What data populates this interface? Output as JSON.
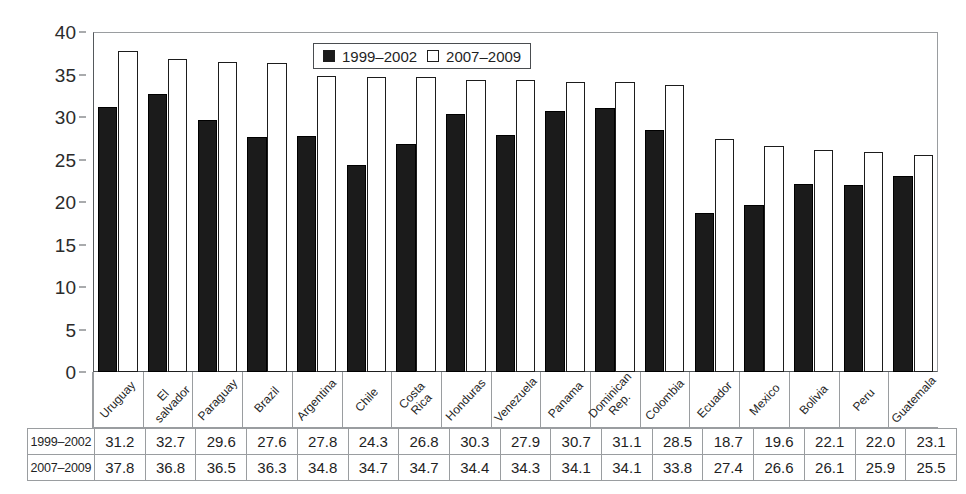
{
  "chart_data": {
    "type": "bar",
    "title": "",
    "subtitle": "",
    "xlabel": "",
    "ylabel": "",
    "ylim": [
      0,
      40
    ],
    "yticks": [
      0,
      5,
      10,
      15,
      20,
      25,
      30,
      35,
      40
    ],
    "grid": false,
    "legend_position": "top-center",
    "categories": [
      "Uruguay",
      "El salvador",
      "Paraguay",
      "Brazil",
      "Argentina",
      "Chile",
      "Costa Rica",
      "Honduras",
      "Venezuela",
      "Panama",
      "Dominican Rep.",
      "Colombia",
      "Ecuador",
      "Mexico",
      "Bolivia",
      "Peru",
      "Guatemala"
    ],
    "category_lines": [
      [
        "Uruguay"
      ],
      [
        "El",
        "salvador"
      ],
      [
        "Paraguay"
      ],
      [
        "Brazil"
      ],
      [
        "Argentina"
      ],
      [
        "Chile"
      ],
      [
        "Costa",
        "Rica"
      ],
      [
        "Honduras"
      ],
      [
        "Venezuela"
      ],
      [
        "Panama"
      ],
      [
        "Dominican",
        "Rep."
      ],
      [
        "Colombia"
      ],
      [
        "Ecuador"
      ],
      [
        "Mexico"
      ],
      [
        "Bolivia"
      ],
      [
        "Peru"
      ],
      [
        "Guatemala"
      ]
    ],
    "series": [
      {
        "name": "1999–2002",
        "color": "#1b1b1b",
        "values": [
          31.2,
          32.7,
          29.6,
          27.6,
          27.8,
          24.3,
          26.8,
          30.3,
          27.9,
          30.7,
          31.1,
          28.5,
          18.7,
          19.6,
          22.1,
          22.0,
          23.1
        ]
      },
      {
        "name": "2007–2009",
        "color": "#ffffff",
        "values": [
          37.8,
          36.8,
          36.5,
          36.3,
          34.8,
          34.7,
          34.7,
          34.4,
          34.3,
          34.1,
          34.1,
          33.8,
          27.4,
          26.6,
          26.1,
          25.9,
          25.5
        ]
      }
    ]
  },
  "legend": {
    "items": [
      {
        "label": "1999–2002",
        "swatch": "dark"
      },
      {
        "label": "2007–2009",
        "swatch": "light"
      }
    ]
  },
  "table": {
    "rows": [
      {
        "header": "1999–2002",
        "values": [
          "31.2",
          "32.7",
          "29.6",
          "27.6",
          "27.8",
          "24.3",
          "26.8",
          "30.3",
          "27.9",
          "30.7",
          "31.1",
          "28.5",
          "18.7",
          "19.6",
          "22.1",
          "22.0",
          "23.1"
        ]
      },
      {
        "header": "2007–2009",
        "values": [
          "37.8",
          "36.8",
          "36.5",
          "36.3",
          "34.8",
          "34.7",
          "34.7",
          "34.4",
          "34.3",
          "34.1",
          "34.1",
          "33.8",
          "27.4",
          "26.6",
          "26.1",
          "25.9",
          "25.5"
        ]
      }
    ]
  },
  "colors": {
    "series_1999_2002": "#1b1b1b",
    "series_2007_2009": "#ffffff",
    "axis": "#55595c",
    "grid_border": "#9a9da0",
    "text": "#1f1f1f",
    "background": "#ffffff"
  }
}
